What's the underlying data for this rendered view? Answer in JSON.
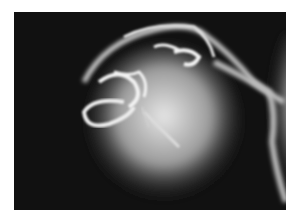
{
  "image": {
    "description": "Lateral radiograph of a skull-like structure with a large rounded soft-tissue mass below, on a black background",
    "colors": {
      "background": "#ffffff",
      "film": "#111111",
      "bone": "#f2f2f2",
      "soft_tissue": "#bdbdbd"
    }
  }
}
